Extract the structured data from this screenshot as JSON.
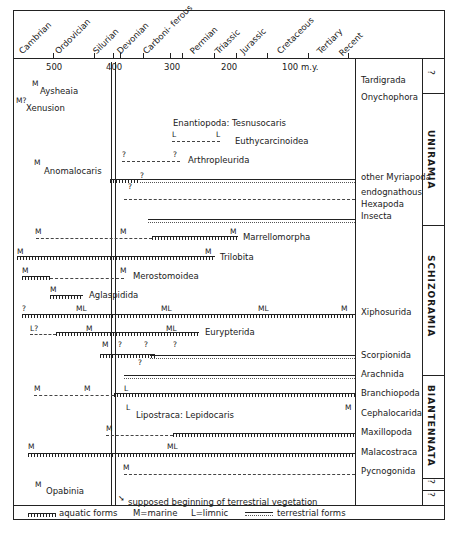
{
  "periods": [
    "Cambrian",
    "Ordovician",
    "Silurian",
    "Devonian",
    "Carboni- ferous",
    "Permian",
    "Triassic",
    "Jurassic",
    "Cretaceous",
    "Tertiary",
    "Recent"
  ],
  "axis_ticks": [
    {
      "label": "500",
      "x": 53
    },
    {
      "label": "400",
      "x": 113
    },
    {
      "label": "300",
      "x": 170
    },
    {
      "label": "200",
      "x": 228
    },
    {
      "label": "100 m.y.",
      "x": 288
    }
  ],
  "groups": {
    "uniramia": "UNIRAMIA",
    "schizoramia": "SCHIZORAMIA",
    "biantennata": "BIANTENNATA",
    "q1": "?",
    "q2": "?",
    "q3": "?"
  },
  "taxa": {
    "tardigrada": "Tardigrada",
    "onychophora": "Onychophora",
    "other_myriapoda": "other Myriapoda",
    "endognathous": "endognathous",
    "hexapoda": "Hexapoda",
    "insecta": "Insecta",
    "xiphosurida": "Xiphosurida",
    "scorpionida": "Scorpionida",
    "arachnida": "Arachnida",
    "branchiopoda": "Branchiopoda",
    "cephalocarida": "Cephalocarida",
    "maxillopoda": "Maxillopoda",
    "malacostraca": "Malacostraca",
    "pycnogonida": "Pycnogonida"
  },
  "fossils": {
    "aysheaia": "Aysheaia",
    "xenusion": "Xenusion",
    "enantiopoda": "Enantiopoda: Tesnusocaris",
    "euthycarcinoidea": "Euthycarcinoidea",
    "arthropleurida": "Arthropleurida",
    "anomalocaris": "Anomalocaris",
    "marrellomorpha": "Marrellomorpha",
    "trilobita": "Trilobita",
    "merostomoidea": "Merostomoidea",
    "aglaspidida": "Aglaspidida",
    "eurypterida": "Eurypterida",
    "lipostraca": "Lipostraca: Lepidocaris",
    "opabinia": "Opabinia"
  },
  "marks": {
    "M": "M",
    "L": "L",
    "ML": "ML",
    "Q": "?",
    "Mq": "M?",
    "Lq": "L?"
  },
  "annotation": "supposed beginning of terrestrial vegetation",
  "legend": {
    "aquatic": "aquatic forms",
    "marine": "M=marine",
    "limnic": "L=limnic",
    "terrestrial": "terrestrial forms"
  }
}
